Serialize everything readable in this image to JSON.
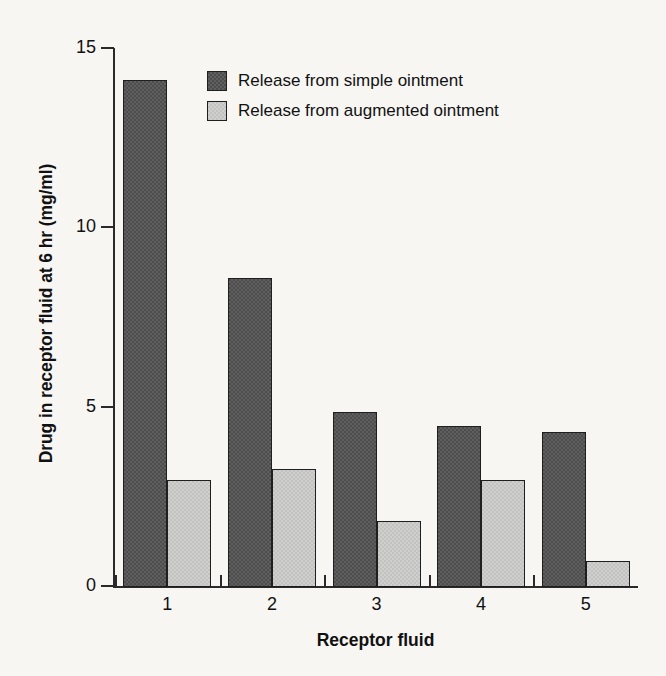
{
  "chart_data": {
    "type": "bar",
    "title": "",
    "xlabel": "Receptor fluid",
    "ylabel": "Drug in receptor fluid at 6 hr (mg/ml)",
    "categories": [
      "1",
      "2",
      "3",
      "4",
      "5"
    ],
    "series": [
      {
        "name": "Release from simple ointment",
        "color": "#4d4d4d",
        "values": [
          14.1,
          8.6,
          4.85,
          4.45,
          4.3
        ]
      },
      {
        "name": "Release from augmented ointment",
        "color": "#c2c2c0",
        "values": [
          2.95,
          3.25,
          1.8,
          2.95,
          0.7
        ]
      }
    ],
    "ylim": [
      0,
      15
    ],
    "yticks": [
      0,
      5,
      10,
      15
    ],
    "ytick_labels": [
      "0",
      "5",
      "10",
      "15"
    ],
    "grid": false,
    "legend_position": "top-center"
  },
  "figure": {
    "background_color": "#f7f6f3",
    "axis_color": "#2a2a2a",
    "text_color": "#111111"
  }
}
